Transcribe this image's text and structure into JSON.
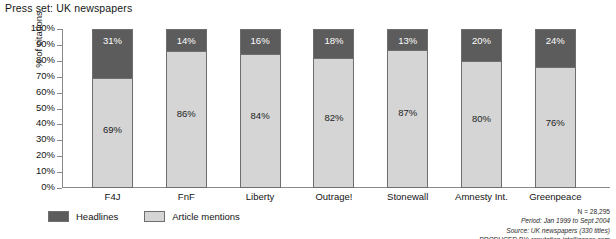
{
  "chart_data": {
    "type": "bar",
    "subtype": "stacked-bar-100",
    "title": "Press set: UK newspapers",
    "xlabel": "",
    "ylabel": "% of citations",
    "ylim": [
      0,
      100
    ],
    "ytick_labels": [
      "100%",
      "90%",
      "80%",
      "70%",
      "60%",
      "50%",
      "40%",
      "30%",
      "20%",
      "10%",
      "0%"
    ],
    "ytick_values": [
      100,
      90,
      80,
      70,
      60,
      50,
      40,
      30,
      20,
      10,
      0
    ],
    "grid": false,
    "legend_position": "bottom-left",
    "categories": [
      "F4J",
      "FnF",
      "Liberty",
      "Outrage!",
      "Stonewall",
      "Amnesty Int.",
      "Greenpeace"
    ],
    "series": [
      {
        "name": "Headlines",
        "color": "#5c5c5c",
        "values": [
          31,
          14,
          16,
          18,
          13,
          20,
          24
        ],
        "labels": [
          "31%",
          "14%",
          "16%",
          "18%",
          "13%",
          "20%",
          "24%"
        ]
      },
      {
        "name": "Article mentions",
        "color": "#d5d5d5",
        "values": [
          69,
          86,
          84,
          82,
          87,
          80,
          76
        ],
        "labels": [
          "69%",
          "86%",
          "84%",
          "82%",
          "87%",
          "80%",
          "76%"
        ]
      }
    ]
  },
  "legend": {
    "items": [
      {
        "label": "Headlines",
        "color": "#5c5c5c"
      },
      {
        "label": "Article mentions",
        "color": "#d5d5d5"
      }
    ]
  },
  "footnote": {
    "line1": "N = 28,295",
    "line2": "Period: Jan 1999 to Sept 2004",
    "line3": "Source: UK newspapers (330 titles)",
    "line4": "PRODUCED BY: reputation-intelligence.com"
  }
}
